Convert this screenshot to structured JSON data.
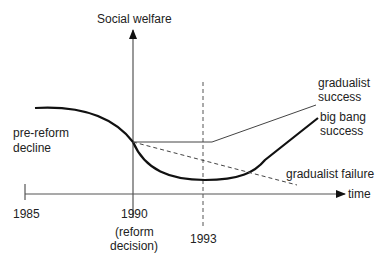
{
  "diagram": {
    "y_axis_label": "Social welfare",
    "x_axis_label": "time",
    "ticks": {
      "t1985": "1985",
      "t1990": "1990",
      "t1990_note_line1": "(reform",
      "t1990_note_line2": "decision)",
      "t1993": "1993"
    },
    "annotations": {
      "pre_reform_line1": "pre-reform",
      "pre_reform_line2": "decline",
      "gradualist_success_line1": "gradualist",
      "gradualist_success_line2": "success",
      "big_bang_line1": "big bang",
      "big_bang_line2": "success",
      "gradualist_failure": "gradualist failure"
    },
    "colors": {
      "axis": "#555555",
      "curve": "#111111",
      "text": "#222222"
    }
  }
}
